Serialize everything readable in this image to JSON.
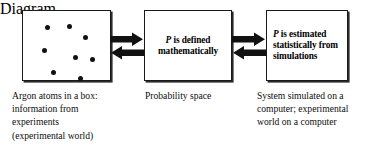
{
  "diagram": {
    "background_color": "#ffffff",
    "line_color": "#1a1a1a",
    "dot_color": "#111111"
  },
  "boxes": {
    "particles": {
      "name": "Argon atoms box",
      "atom_count": 8,
      "atoms": [
        {
          "x": 22.0,
          "y": 14.0
        },
        {
          "x": 43.5,
          "y": 13.0
        },
        {
          "x": 60.0,
          "y": 24.0
        },
        {
          "x": 18.5,
          "y": 36.5
        },
        {
          "x": 50.0,
          "y": 44.0
        },
        {
          "x": 66.5,
          "y": 45.5
        },
        {
          "x": 27.5,
          "y": 59.0
        },
        {
          "x": 55.0,
          "y": 64.5
        }
      ]
    },
    "probability": {
      "name": "Probability space box",
      "text_prefix": "P",
      "text_rest": " is defined mathematically"
    },
    "simulation": {
      "name": "Simulation box",
      "text_prefix": "P",
      "text_rest": " is estimated statistically from simulations"
    }
  },
  "arrows": {
    "left_pair": {
      "name": "bidirectional arrows between argon box and probability box",
      "top_direction": "right",
      "bottom_direction": "left"
    },
    "right_pair": {
      "name": "bidirectional arrows between probability box and simulation box",
      "top_direction": "right",
      "bottom_direction": "left"
    }
  },
  "captions": {
    "particles": "Argon atoms in a box:\ninformation from\nexperiments\n(experimental world)",
    "probability": "Probability space",
    "simulation": "System simulated on a\ncomputer; experimental\nworld on a computer"
  }
}
